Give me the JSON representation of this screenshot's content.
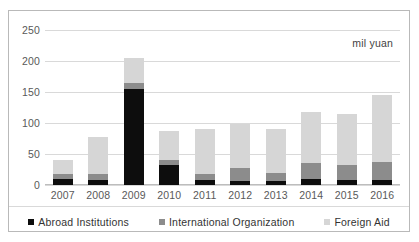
{
  "annotation": {
    "unit_note": "mil yuan"
  },
  "chart_data": {
    "type": "bar",
    "subtype": "stacked-column",
    "title": "",
    "xlabel": "",
    "ylabel": "",
    "unit_label": "mil yuan",
    "categories": [
      "2007",
      "2008",
      "2009",
      "2010",
      "2011",
      "2012",
      "2013",
      "2014",
      "2015",
      "2016"
    ],
    "ylim": [
      0,
      250
    ],
    "yticks": [
      0,
      50,
      100,
      150,
      200,
      250
    ],
    "ytick_labels": [
      "0",
      "50",
      "100",
      "150",
      "200",
      "250"
    ],
    "grid": true,
    "legend_position": "bottom",
    "series": [
      {
        "name": "Abroad Institutions",
        "color": "#0d0d0d",
        "values": [
          9,
          8,
          155,
          33,
          8,
          7,
          7,
          10,
          8,
          8
        ]
      },
      {
        "name": "International Organization",
        "color": "#8c8c8c",
        "values": [
          9,
          10,
          9,
          7,
          9,
          21,
          12,
          25,
          24,
          29
        ]
      },
      {
        "name": "Foreign Aid",
        "color": "#d6d6d6",
        "values": [
          23,
          60,
          41,
          47,
          74,
          70,
          72,
          82,
          82,
          108
        ]
      }
    ],
    "totals": [
      41,
      78,
      205,
      87,
      91,
      98,
      91,
      117,
      114,
      145
    ]
  },
  "legend": {
    "items": [
      {
        "label": "Abroad Institutions",
        "color": "#0d0d0d"
      },
      {
        "label": "International Organization",
        "color": "#8c8c8c"
      },
      {
        "label": "Foreign Aid",
        "color": "#d6d6d6"
      }
    ]
  }
}
